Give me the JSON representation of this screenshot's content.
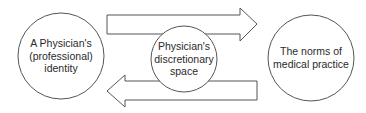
{
  "diagram": {
    "nodes": [
      {
        "id": "identity",
        "lines": [
          "A Physician's",
          "(professional)",
          "identity"
        ]
      },
      {
        "id": "discretionary",
        "lines": [
          "Physician's",
          "discretionary",
          "space"
        ]
      },
      {
        "id": "norms",
        "lines": [
          "The norms of",
          "medical practice"
        ]
      }
    ],
    "edges": [
      {
        "from": "identity",
        "to": "norms",
        "direction": "right"
      },
      {
        "from": "norms",
        "to": "identity",
        "direction": "left"
      }
    ],
    "colors": {
      "stroke": "#555555",
      "fill": "#ffffff",
      "text": "#2a2a2a"
    }
  }
}
